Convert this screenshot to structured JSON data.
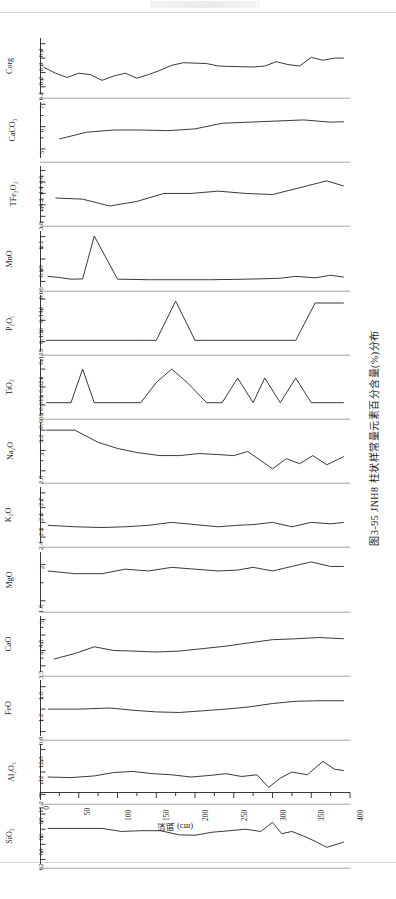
{
  "figure": {
    "caption": "图3-95  JNH8 柱状样常量元素百分含量(%)分布",
    "xlabel": "深度 (cm)",
    "xticks_labeled": [
      "0",
      "50",
      "100",
      "150",
      "200",
      "250",
      "300",
      "350",
      "400"
    ],
    "xlim": [
      0,
      400
    ],
    "xtick_step_minor": 25
  },
  "chart_data": [
    {
      "type": "line",
      "title": "Corg",
      "ylabel": "Corg",
      "xlabel": "深度 (cm)",
      "ylim": [
        0.05,
        0.44
      ],
      "yticks": [
        0.1,
        0.2,
        0.3,
        0.4
      ],
      "ytick_labels": [
        "0.1",
        "0.2",
        "0.3",
        "0.4"
      ],
      "grid": false,
      "x": [
        5,
        20,
        35,
        50,
        65,
        80,
        95,
        110,
        125,
        140,
        155,
        170,
        185,
        200,
        215,
        230,
        245,
        260,
        275,
        290,
        305,
        320,
        335,
        350,
        365,
        380,
        392
      ],
      "values": [
        0.235,
        0.195,
        0.165,
        0.195,
        0.185,
        0.145,
        0.175,
        0.195,
        0.16,
        0.185,
        0.215,
        0.25,
        0.268,
        0.265,
        0.262,
        0.245,
        0.242,
        0.24,
        0.238,
        0.245,
        0.275,
        0.255,
        0.245,
        0.305,
        0.285,
        0.3,
        0.3
      ]
    },
    {
      "type": "line",
      "title": "CaCO3",
      "ylabel": "CaCO₃",
      "ylim": [
        4.6,
        7.1
      ],
      "yticks": [
        5,
        6,
        7
      ],
      "ytick_labels": [
        "5",
        "6",
        "7"
      ],
      "grid": false,
      "x": [
        25,
        60,
        95,
        130,
        165,
        200,
        235,
        270,
        305,
        340,
        375,
        392
      ],
      "values": [
        5.45,
        5.75,
        5.85,
        5.85,
        5.82,
        5.9,
        6.15,
        6.2,
        6.25,
        6.3,
        6.2,
        6.22
      ]
    },
    {
      "type": "line",
      "title": "TFe2O3",
      "ylabel": "TFe₂O₃",
      "ylim": [
        3.7,
        4.68
      ],
      "yticks": [
        3.8,
        4.0,
        4.2,
        4.4,
        4.6
      ],
      "ytick_labels": [
        "3.8",
        "4",
        "4.2",
        "4.4",
        "4.6"
      ],
      "grid": false,
      "x": [
        20,
        55,
        90,
        125,
        160,
        195,
        230,
        265,
        300,
        335,
        370,
        392
      ],
      "values": [
        4.12,
        4.1,
        3.98,
        4.06,
        4.2,
        4.2,
        4.24,
        4.2,
        4.18,
        4.3,
        4.42,
        4.33
      ]
    },
    {
      "type": "line",
      "title": "MnO",
      "ylabel": "MnO",
      "ylim": [
        0.055,
        0.105
      ],
      "yticks": [
        0.06,
        0.08,
        0.1
      ],
      "ytick_labels": [
        "0.06",
        "0.08",
        "0.1"
      ],
      "grid": false,
      "x": [
        10,
        25,
        40,
        55,
        70,
        100,
        140,
        180,
        220,
        250,
        280,
        310,
        330,
        355,
        375,
        392
      ],
      "values": [
        0.0645,
        0.0635,
        0.062,
        0.0622,
        0.1005,
        0.062,
        0.0615,
        0.0615,
        0.0615,
        0.0618,
        0.0622,
        0.0628,
        0.0645,
        0.0632,
        0.0655,
        0.0638
      ]
    },
    {
      "type": "line",
      "title": "P2O5",
      "ylabel": "P₂O₅",
      "ylim": [
        0.1245,
        0.1455
      ],
      "yticks": [
        0.128,
        0.136,
        0.144
      ],
      "ytick_labels": [
        "0.128",
        "0.136",
        "0.144"
      ],
      "grid": false,
      "x": [
        8,
        130,
        150,
        175,
        200,
        215,
        330,
        355,
        392
      ],
      "values": [
        0.1285,
        0.1285,
        0.1285,
        0.1432,
        0.1285,
        0.1285,
        0.1285,
        0.1425,
        0.1425
      ]
    },
    {
      "type": "line",
      "title": "TiO2",
      "ylabel": "TiO₂",
      "ylim": [
        0.6035,
        0.6285
      ],
      "yticks": [
        0.608,
        0.616,
        0.624
      ],
      "ytick_labels": [
        "0.608",
        "0.616",
        "0.624"
      ],
      "grid": false,
      "x": [
        8,
        40,
        55,
        70,
        85,
        100,
        130,
        150,
        170,
        190,
        215,
        235,
        255,
        275,
        290,
        310,
        330,
        350,
        370,
        392
      ],
      "values": [
        0.609,
        0.609,
        0.624,
        0.609,
        0.609,
        0.609,
        0.609,
        0.618,
        0.624,
        0.618,
        0.609,
        0.609,
        0.62,
        0.609,
        0.62,
        0.609,
        0.62,
        0.609,
        0.609,
        0.609
      ]
    },
    {
      "type": "line",
      "title": "Na2O",
      "ylabel": "Na₂O",
      "ylim": [
        2.72,
        3.27
      ],
      "yticks": [
        2.8,
        3.0,
        3.2
      ],
      "ytick_labels": [
        "2.8",
        "3",
        "3.2"
      ],
      "grid": false,
      "x": [
        8,
        45,
        75,
        100,
        125,
        155,
        180,
        205,
        230,
        250,
        268,
        285,
        300,
        318,
        335,
        352,
        370,
        392
      ],
      "values": [
        3.2,
        3.2,
        3.08,
        3.02,
        2.98,
        2.95,
        2.95,
        2.97,
        2.96,
        2.95,
        2.99,
        2.9,
        2.82,
        2.92,
        2.87,
        2.95,
        2.86,
        2.94
      ]
    },
    {
      "type": "line",
      "title": "K2O",
      "ylabel": "K₂O",
      "ylim": [
        2.36,
        2.74
      ],
      "yticks": [
        2.4,
        2.5,
        2.6,
        2.7
      ],
      "ytick_labels": [
        "2.4",
        "2.5",
        "2.6",
        "2.7"
      ],
      "grid": false,
      "x": [
        10,
        45,
        80,
        110,
        140,
        170,
        200,
        230,
        255,
        275,
        300,
        325,
        350,
        375,
        392
      ],
      "values": [
        2.48,
        2.47,
        2.465,
        2.47,
        2.48,
        2.5,
        2.485,
        2.47,
        2.48,
        2.485,
        2.5,
        2.47,
        2.5,
        2.49,
        2.5
      ]
    },
    {
      "type": "line",
      "title": "MgO",
      "ylabel": "MgO",
      "ylim": [
        1.52,
        2.14
      ],
      "yticks": [
        1.6,
        2.0
      ],
      "ytick_labels": [
        "1.6",
        "2"
      ],
      "grid": false,
      "x": [
        10,
        45,
        80,
        110,
        140,
        170,
        200,
        230,
        255,
        275,
        300,
        325,
        350,
        375,
        392
      ],
      "values": [
        1.93,
        1.9,
        1.9,
        1.95,
        1.93,
        1.97,
        1.95,
        1.93,
        1.94,
        1.97,
        1.93,
        1.98,
        2.03,
        1.98,
        1.98
      ]
    },
    {
      "type": "line",
      "title": "CaO",
      "ylabel": "CaO",
      "ylim": [
        3.3,
        5.12
      ],
      "yticks": [
        3.5,
        4.0,
        4.5,
        5.0
      ],
      "ytick_labels": [
        "3.5",
        "4",
        "4.5",
        "5"
      ],
      "grid": false,
      "x": [
        18,
        45,
        70,
        95,
        120,
        150,
        180,
        210,
        240,
        270,
        300,
        330,
        360,
        392
      ],
      "values": [
        3.72,
        3.9,
        4.12,
        4.0,
        3.98,
        3.95,
        3.98,
        4.06,
        4.14,
        4.25,
        4.35,
        4.38,
        4.42,
        4.38
      ]
    },
    {
      "type": "line",
      "title": "FeO",
      "ylabel": "FeO",
      "ylim": [
        0.72,
        1.72
      ],
      "yticks": [
        0.8,
        1.2,
        1.6
      ],
      "ytick_labels": [
        "0.8",
        "1.2",
        "1.6"
      ],
      "grid": false,
      "x": [
        10,
        50,
        90,
        120,
        150,
        180,
        210,
        240,
        270,
        300,
        330,
        360,
        392
      ],
      "values": [
        1.2,
        1.2,
        1.22,
        1.18,
        1.15,
        1.14,
        1.17,
        1.2,
        1.24,
        1.3,
        1.34,
        1.35,
        1.35
      ]
    },
    {
      "type": "line",
      "title": "Al2O3",
      "ylabel": "Al₂O₃",
      "ylim": [
        11.0,
        13.0
      ],
      "yticks": [
        11.2,
        12.0,
        12.8
      ],
      "ytick_labels": [
        "11.2",
        "12",
        "12.8"
      ],
      "grid": false,
      "x": [
        10,
        40,
        70,
        95,
        120,
        145,
        170,
        195,
        220,
        240,
        260,
        280,
        295,
        310,
        325,
        345,
        365,
        380,
        392
      ],
      "values": [
        11.82,
        11.8,
        11.86,
        11.98,
        12.02,
        11.94,
        11.9,
        11.82,
        11.88,
        11.94,
        11.84,
        11.9,
        11.45,
        11.78,
        12.0,
        11.9,
        12.38,
        12.1,
        12.05
      ]
    },
    {
      "type": "line",
      "title": "SiO2",
      "ylabel": "SiO₂",
      "ylim": [
        61.4,
        68.8
      ],
      "yticks": [
        62,
        64,
        66,
        68
      ],
      "ytick_labels": [
        "62",
        "64",
        "66",
        "68"
      ],
      "grid": false,
      "x": [
        10,
        45,
        80,
        105,
        130,
        155,
        180,
        200,
        222,
        245,
        265,
        285,
        300,
        312,
        325,
        340,
        355,
        370,
        392
      ],
      "values": [
        66.1,
        66.1,
        66.1,
        65.7,
        65.8,
        65.8,
        65.25,
        65.2,
        65.6,
        65.8,
        66.0,
        65.7,
        66.9,
        65.4,
        65.7,
        65.1,
        64.4,
        63.6,
        64.3
      ]
    }
  ]
}
